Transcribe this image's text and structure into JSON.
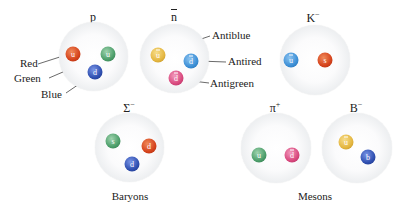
{
  "colors": {
    "red": "#d5431c",
    "green": "#4c9e6a",
    "blue": "#2f4fb0",
    "antiblue": "#e4b640",
    "antired": "#3c8fd6",
    "antigreen": "#d9497e",
    "leader_line": "#444444"
  },
  "baryons": {
    "group_label": "Baryons",
    "particles": [
      {
        "name": "p",
        "symbol": "p",
        "superscript": "",
        "quarks": [
          {
            "flavor": "u",
            "anti": false,
            "color": "red"
          },
          {
            "flavor": "u",
            "anti": false,
            "color": "green"
          },
          {
            "flavor": "d",
            "anti": false,
            "color": "blue"
          }
        ],
        "callouts": [
          "Red",
          "Green",
          "Blue"
        ]
      },
      {
        "name": "antineutron",
        "symbol": "n",
        "overline": true,
        "superscript": "",
        "quarks": [
          {
            "flavor": "u",
            "anti": true,
            "color": "antiblue"
          },
          {
            "flavor": "d",
            "anti": true,
            "color": "antired"
          },
          {
            "flavor": "d",
            "anti": true,
            "color": "antigreen"
          }
        ],
        "callouts": [
          "Antiblue",
          "Antired",
          "Antigreen"
        ]
      },
      {
        "name": "Sigma-minus",
        "symbol": "Σ",
        "superscript": "−",
        "quarks": [
          {
            "flavor": "s",
            "anti": false,
            "color": "green"
          },
          {
            "flavor": "d",
            "anti": false,
            "color": "red"
          },
          {
            "flavor": "d",
            "anti": false,
            "color": "blue"
          }
        ]
      }
    ]
  },
  "mesons": {
    "group_label": "Mesons",
    "particles": [
      {
        "name": "K-minus",
        "symbol": "K",
        "superscript": "−",
        "quarks": [
          {
            "flavor": "u",
            "anti": true,
            "color": "antired"
          },
          {
            "flavor": "s",
            "anti": false,
            "color": "red"
          }
        ]
      },
      {
        "name": "pi-plus",
        "symbol": "π",
        "superscript": "+",
        "quarks": [
          {
            "flavor": "u",
            "anti": false,
            "color": "green"
          },
          {
            "flavor": "d",
            "anti": true,
            "color": "antigreen"
          }
        ]
      },
      {
        "name": "B-minus",
        "symbol": "B",
        "superscript": "−",
        "quarks": [
          {
            "flavor": "u",
            "anti": true,
            "color": "antiblue"
          },
          {
            "flavor": "b",
            "anti": false,
            "color": "blue"
          }
        ]
      }
    ]
  }
}
